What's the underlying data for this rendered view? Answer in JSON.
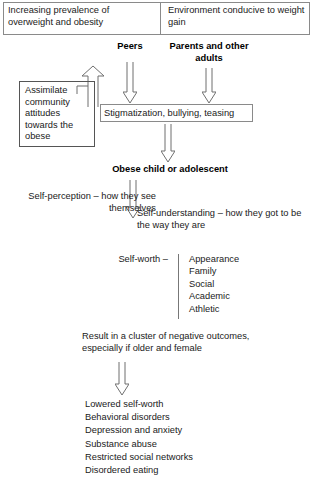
{
  "diagram": {
    "banner": {
      "left_text": "Increasing prevalence of overweight and obesity",
      "right_text": "Environment conducive to weight gain"
    },
    "influencers": {
      "peers_label": "Peers",
      "parents_label": "Parents and other adults"
    },
    "assimilate_box": {
      "text": "Assimilate community attitudes towards the obese"
    },
    "stigmatization_box": {
      "text": "Stigmatization, bullying, teasing"
    },
    "obese_node": {
      "label": "Obese child or adolescent"
    },
    "self_perception": {
      "text": "Self-perception – how they see themselves"
    },
    "self_understanding": {
      "text": "Self-understanding – how they got to be the way they are"
    },
    "self_worth": {
      "label": "Self-worth –",
      "domains": [
        "Appearance",
        "Family",
        "Social",
        "Academic",
        "Athletic"
      ]
    },
    "result_statement": {
      "text": "Result in a cluster of negative outcomes, especially if older and female"
    },
    "outcomes": [
      "Lowered self-worth",
      "Behavioral disorders",
      "Depression and anxiety",
      "Substance abuse",
      "Restricted social networks",
      "Disordered eating"
    ],
    "arrows": [
      {
        "name": "arrow-up-to-peers",
        "direction": "up"
      },
      {
        "name": "arrow-peers-to-stigmatization",
        "direction": "down"
      },
      {
        "name": "arrow-parents-to-stigmatization",
        "direction": "down"
      },
      {
        "name": "arrow-stigmatization-to-obese",
        "direction": "down"
      },
      {
        "name": "arrow-obese-to-self",
        "direction": "down"
      },
      {
        "name": "arrow-result-to-outcomes",
        "direction": "down"
      }
    ],
    "colors": {
      "line": "#6f6f6f",
      "box_border": "#8a8a8a",
      "text": "#1a1a1a",
      "background": "#ffffff"
    }
  }
}
